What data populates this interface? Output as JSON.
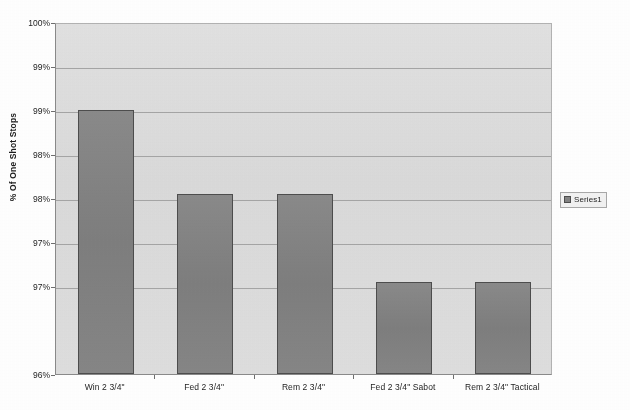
{
  "chart_data": {
    "type": "bar",
    "title": "",
    "xlabel": "",
    "ylabel": "% Of One Shot Stops",
    "categories": [
      "Win 2 3/4\"",
      "Fed 2 3/4\"",
      "Rem 2 3/4\"",
      "Fed 2 3/4\" Sabot",
      "Rem 2 3/4\" Tactical"
    ],
    "values": [
      99.0,
      98.05,
      98.05,
      97.05,
      97.05
    ],
    "series": [
      {
        "name": "Series1",
        "values": [
          99.0,
          98.05,
          98.05,
          97.05,
          97.05
        ]
      }
    ],
    "ylim": [
      96.0,
      100.0
    ],
    "ytick_values": [
      100.0,
      99.5,
      99.0,
      98.5,
      98.0,
      97.5,
      97.0,
      96.5,
      96.0
    ],
    "ytick_labels": [
      "100%",
      "99%",
      "99%",
      "98%",
      "98%",
      "97%",
      "97%",
      "96%"
    ],
    "grid": true,
    "legend_position": "right",
    "colors": {
      "bar_fill": "#838383",
      "bar_border": "#4d4d4d",
      "plot_background": "#dcdcdc",
      "gridline": "#9b9b9b",
      "axis": "#8a8a8a",
      "text": "#1d1d1d"
    }
  },
  "yaxis": {
    "title": "% Of One Shot Stops",
    "ticks": [
      {
        "label": "100%",
        "value": 100.0
      },
      {
        "label": "99%",
        "value": 99.5
      },
      {
        "label": "99%",
        "value": 99.0
      },
      {
        "label": "98%",
        "value": 98.5
      },
      {
        "label": "98%",
        "value": 98.0
      },
      {
        "label": "97%",
        "value": 97.5
      },
      {
        "label": "97%",
        "value": 97.0
      },
      {
        "label": "96%",
        "value": 96.0
      }
    ]
  },
  "xaxis": {
    "ticks": [
      {
        "label": "Win 2 3/4\""
      },
      {
        "label": "Fed 2 3/4\""
      },
      {
        "label": "Rem 2 3/4\""
      },
      {
        "label": "Fed 2 3/4\" Sabot"
      },
      {
        "label": "Rem 2 3/4\" Tactical"
      }
    ]
  },
  "legend": {
    "entries": [
      {
        "label": "Series1",
        "color": "#838383"
      }
    ]
  },
  "title": {
    "text": ""
  }
}
